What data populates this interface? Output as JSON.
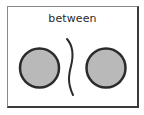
{
  "card": {
    "label": "between"
  },
  "figure": {
    "shapes": [
      "circle",
      "wavy-line",
      "circle"
    ],
    "colors": {
      "circle_fill": "#b9b9b9",
      "circle_stroke": "#2b2b2b",
      "line_stroke": "#2b2b2b"
    }
  }
}
